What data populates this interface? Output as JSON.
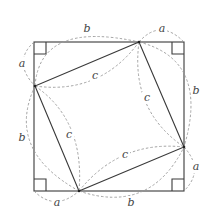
{
  "diagram": {
    "type": "geometric-proof",
    "outer_square": {
      "corners": [
        [
          34,
          42
        ],
        [
          184,
          42
        ],
        [
          184,
          191
        ],
        [
          34,
          191
        ]
      ]
    },
    "inner_square": {
      "vertices": [
        [
          139,
          42
        ],
        [
          184,
          147
        ],
        [
          79,
          191
        ],
        [
          35,
          86
        ]
      ]
    },
    "right_angle_markers": 4,
    "labels": [
      {
        "id": "b-top",
        "text": "b",
        "x": 87,
        "y": 29
      },
      {
        "id": "a-top",
        "text": "a",
        "x": 162,
        "y": 29
      },
      {
        "id": "a-left",
        "text": "a",
        "x": 22,
        "y": 64
      },
      {
        "id": "b-right",
        "text": "b",
        "x": 196,
        "y": 91
      },
      {
        "id": "c-top",
        "text": "c",
        "x": 95,
        "y": 76
      },
      {
        "id": "c-right",
        "text": "c",
        "x": 147,
        "y": 98
      },
      {
        "id": "b-left",
        "text": "b",
        "x": 22,
        "y": 138
      },
      {
        "id": "c-left",
        "text": "c",
        "x": 69,
        "y": 135
      },
      {
        "id": "c-bottom",
        "text": "c",
        "x": 125,
        "y": 155
      },
      {
        "id": "a-right",
        "text": "a",
        "x": 196,
        "y": 167
      },
      {
        "id": "a-bottom",
        "text": "a",
        "x": 57,
        "y": 203
      },
      {
        "id": "b-bottom",
        "text": "b",
        "x": 131,
        "y": 203
      }
    ],
    "colors": {
      "solid": "#3a3a3a",
      "dashed": "#9a9a9a",
      "text": "#444444"
    }
  }
}
